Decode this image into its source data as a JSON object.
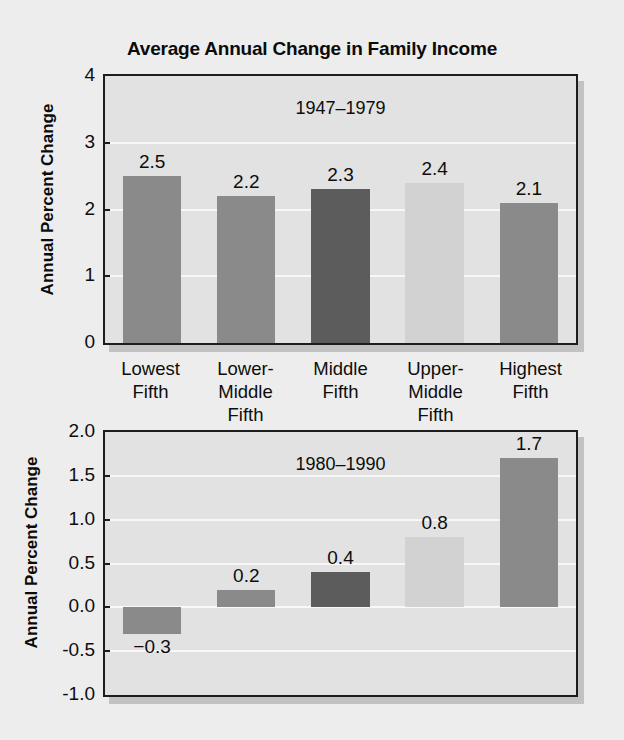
{
  "figure": {
    "title": "Average Annual Change in Family Income",
    "background_color": "#ededed",
    "plot_background_color": "#e2e2e2",
    "axis_color": "#1d1d1d",
    "gridline_color": "#f7f7f7"
  },
  "categories": [
    {
      "line1": "Lowest",
      "line2": "Fifth"
    },
    {
      "line1": "Lower-",
      "line2": "Middle Fifth"
    },
    {
      "line1": "Middle",
      "line2": "Fifth"
    },
    {
      "line1": "Upper-",
      "line2": "Middle Fifth"
    },
    {
      "line1": "Highest",
      "line2": "Fifth"
    }
  ],
  "panels": [
    {
      "subtitle": "1947–1979",
      "ylabel": "Annual Percent Change",
      "yticks": [
        "0",
        "1",
        "2",
        "3",
        "4"
      ],
      "bar_labels": [
        "2.5",
        "2.2",
        "2.3",
        "2.4",
        "2.1"
      ]
    },
    {
      "subtitle": "1980–1990",
      "ylabel": "Annual Percent Change",
      "yticks": [
        "-1.0",
        "-0.5",
        "0.0",
        "0.5",
        "1.0",
        "1.5",
        "2.0"
      ],
      "bar_labels": [
        "−0.3",
        "0.2",
        "0.4",
        "0.8",
        "1.7"
      ]
    }
  ],
  "chart_data": {
    "type": "bar",
    "title": "Average Annual Change in Family Income",
    "xlabel": "",
    "ylabel": "Annual Percent Change",
    "categories": [
      "Lowest Fifth",
      "Lower-Middle Fifth",
      "Middle Fifth",
      "Upper-Middle Fifth",
      "Highest Fifth"
    ],
    "panels": [
      {
        "subtitle": "1947–1979",
        "values": [
          2.5,
          2.2,
          2.3,
          2.4,
          2.1
        ],
        "ylim": [
          0,
          4
        ],
        "ytick_values": [
          0,
          1,
          2,
          3,
          4
        ],
        "ytick_labels": [
          "0",
          "1",
          "2",
          "3",
          "4"
        ],
        "grid": true,
        "legend": "none",
        "bar_colors": [
          "#8a8a8a",
          "#8a8a8a",
          "#5c5c5c",
          "#d2d2d2",
          "#8a8a8a"
        ]
      },
      {
        "subtitle": "1980–1990",
        "values": [
          -0.3,
          0.2,
          0.4,
          0.8,
          1.7
        ],
        "ylim": [
          -1.0,
          2.0
        ],
        "ytick_values": [
          -1.0,
          -0.5,
          0.0,
          0.5,
          1.0,
          1.5,
          2.0
        ],
        "ytick_labels": [
          "-1.0",
          "-0.5",
          "0.0",
          "0.5",
          "1.0",
          "1.5",
          "2.0"
        ],
        "grid": true,
        "legend": "none",
        "bar_colors": [
          "#8a8a8a",
          "#8a8a8a",
          "#5c5c5c",
          "#d2d2d2",
          "#8a8a8a"
        ]
      }
    ]
  }
}
